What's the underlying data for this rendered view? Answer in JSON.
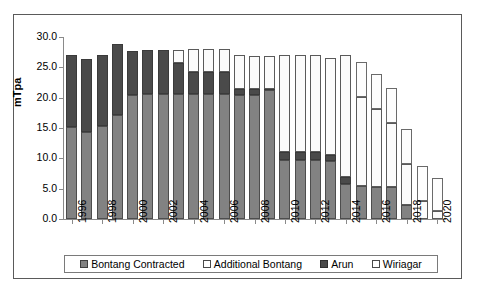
{
  "chart_data": {
    "type": "bar",
    "subtype": "stacked-vertical",
    "title": "",
    "xlabel": "",
    "ylabel": "mTpa",
    "ylim": [
      0.0,
      30.0
    ],
    "yticks": [
      "0.0",
      "5.0",
      "10.0",
      "15.0",
      "20.0",
      "25.0",
      "30.0"
    ],
    "ytick_values": [
      0.0,
      5.0,
      10.0,
      15.0,
      20.0,
      25.0,
      30.0
    ],
    "grid": false,
    "legend_position": "bottom",
    "categories": [
      "1996",
      "1997",
      "1998",
      "1999",
      "2000",
      "2001",
      "2002",
      "2003",
      "2004",
      "2005",
      "2006",
      "2007",
      "2008",
      "2009",
      "2010",
      "2011",
      "2012",
      "2013",
      "2014",
      "2015",
      "2016",
      "2017",
      "2018",
      "2019",
      "2020"
    ],
    "xtick_labels": [
      "1996",
      "1998",
      "2000",
      "2002",
      "2004",
      "2006",
      "2008",
      "2010",
      "2012",
      "2014",
      "2016",
      "2018",
      "2020"
    ],
    "series": [
      {
        "name": "Bontang Contracted",
        "color": "#828282",
        "values": [
          15.1,
          14.3,
          15.4,
          17.1,
          20.4,
          20.6,
          20.6,
          20.6,
          20.6,
          20.6,
          20.6,
          20.4,
          20.4,
          21.2,
          9.8,
          9.8,
          9.8,
          9.5,
          5.8,
          5.4,
          5.2,
          5.2,
          2.3,
          0.0,
          0.0
        ]
      },
      {
        "name": "Arun",
        "color": "#4a4a4a",
        "values": [
          11.9,
          12.0,
          11.6,
          11.7,
          7.3,
          7.3,
          7.3,
          5.1,
          3.7,
          3.7,
          3.6,
          1.1,
          1.0,
          0.2,
          1.2,
          1.2,
          1.2,
          1.1,
          1.2,
          0.0,
          0.0,
          0.0,
          0.0,
          0.0,
          0.0
        ]
      },
      {
        "name": "Additional Bontang",
        "color": "#fbfbfb",
        "values": [
          0.0,
          0.0,
          0.0,
          0.0,
          0.0,
          0.0,
          0.0,
          2.2,
          3.8,
          3.8,
          3.8,
          5.5,
          5.5,
          5.5,
          16.0,
          16.0,
          16.0,
          15.9,
          20.0,
          14.7,
          12.9,
          10.7,
          6.8,
          3.0,
          1.3
        ]
      },
      {
        "name": "Wiriagar",
        "color": "#fdfdfd",
        "values": [
          0.0,
          0.0,
          0.0,
          0.0,
          0.0,
          0.0,
          0.0,
          0.0,
          0.0,
          0.0,
          0.0,
          0.0,
          0.0,
          0.0,
          0.0,
          0.0,
          0.0,
          0.0,
          0.0,
          5.7,
          5.8,
          5.7,
          5.7,
          5.7,
          5.5
        ]
      }
    ],
    "totals": [
      27.0,
      26.3,
      27.0,
      28.8,
      27.7,
      27.9,
      27.9,
      27.9,
      28.1,
      28.1,
      28.0,
      27.0,
      26.9,
      26.9,
      27.0,
      27.0,
      27.0,
      26.5,
      27.0,
      25.8,
      23.9,
      21.6,
      14.8,
      8.7,
      6.8
    ]
  },
  "legend": {
    "items": [
      {
        "label": "Bontang Contracted",
        "swatch": "filled-gray"
      },
      {
        "label": "Additional Bontang",
        "swatch": "empty-white"
      },
      {
        "label": "Arun",
        "swatch": "filled-darkgray"
      },
      {
        "label": "Wiriagar",
        "swatch": "empty-white"
      }
    ]
  },
  "colors": {
    "bontang_contracted": "#828282",
    "arun": "#4a4a4a",
    "additional_bontang": "#fbfbfb",
    "wiriagar": "#fdfdfd",
    "axis": "#8a8a8a",
    "frame": "#5a5a5a"
  }
}
